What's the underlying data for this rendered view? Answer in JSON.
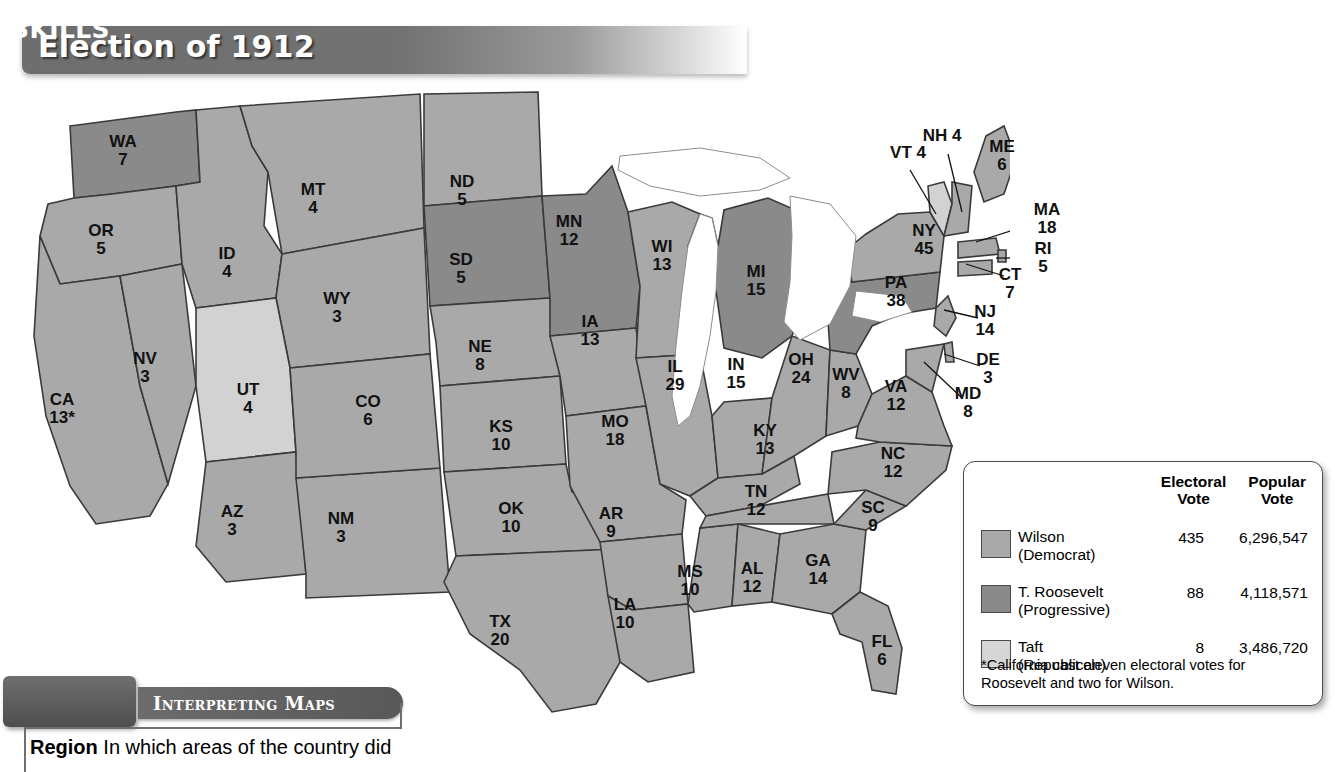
{
  "title": "Election of 1912",
  "chart_data": {
    "type": "map",
    "title": "Election of 1912",
    "categories": [
      "Wilson (Democrat)",
      "T. Roosevelt (Progressive)",
      "Taft (Republican)"
    ],
    "series": [
      {
        "name": "Electoral Vote",
        "values": [
          435,
          88,
          8
        ]
      },
      {
        "name": "Popular Vote",
        "values": [
          6296547,
          4118571,
          3486720
        ]
      }
    ],
    "colors": {
      "wilson": "#a9a9a9",
      "roosevelt": "#8a8a8a",
      "taft": "#d2d2d2"
    },
    "states": [
      {
        "ab": "WA",
        "ev": 7,
        "winner": "roosevelt",
        "x": 123,
        "y": 65
      },
      {
        "ab": "OR",
        "ev": 5,
        "winner": "wilson",
        "x": 101,
        "y": 154
      },
      {
        "ab": "CA",
        "ev": "13*",
        "winner": "wilson",
        "x": 62,
        "y": 323
      },
      {
        "ab": "NV",
        "ev": 3,
        "winner": "wilson",
        "x": 145,
        "y": 282
      },
      {
        "ab": "ID",
        "ev": 4,
        "winner": "wilson",
        "x": 227,
        "y": 177
      },
      {
        "ab": "MT",
        "ev": 4,
        "winner": "wilson",
        "x": 313,
        "y": 113
      },
      {
        "ab": "WY",
        "ev": 3,
        "winner": "wilson",
        "x": 337,
        "y": 222
      },
      {
        "ab": "UT",
        "ev": 4,
        "winner": "taft",
        "x": 248,
        "y": 313
      },
      {
        "ab": "AZ",
        "ev": 3,
        "winner": "wilson",
        "x": 232,
        "y": 435
      },
      {
        "ab": "NM",
        "ev": 3,
        "winner": "wilson",
        "x": 341,
        "y": 442
      },
      {
        "ab": "CO",
        "ev": 6,
        "winner": "wilson",
        "x": 368,
        "y": 325
      },
      {
        "ab": "ND",
        "ev": 5,
        "winner": "wilson",
        "x": 462,
        "y": 105
      },
      {
        "ab": "SD",
        "ev": 5,
        "winner": "roosevelt",
        "x": 461,
        "y": 183
      },
      {
        "ab": "NE",
        "ev": 8,
        "winner": "wilson",
        "x": 480,
        "y": 270
      },
      {
        "ab": "KS",
        "ev": 10,
        "winner": "wilson",
        "x": 501,
        "y": 350
      },
      {
        "ab": "OK",
        "ev": 10,
        "winner": "wilson",
        "x": 511,
        "y": 432
      },
      {
        "ab": "TX",
        "ev": 20,
        "winner": "wilson",
        "x": 500,
        "y": 545
      },
      {
        "ab": "MN",
        "ev": 12,
        "winner": "roosevelt",
        "x": 569,
        "y": 145
      },
      {
        "ab": "IA",
        "ev": 13,
        "winner": "wilson",
        "x": 590,
        "y": 245
      },
      {
        "ab": "MO",
        "ev": 18,
        "winner": "wilson",
        "x": 615,
        "y": 345
      },
      {
        "ab": "AR",
        "ev": 9,
        "winner": "wilson",
        "x": 611,
        "y": 437
      },
      {
        "ab": "LA",
        "ev": 10,
        "winner": "wilson",
        "x": 625,
        "y": 528
      },
      {
        "ab": "WI",
        "ev": 13,
        "winner": "wilson",
        "x": 662,
        "y": 170
      },
      {
        "ab": "IL",
        "ev": 29,
        "winner": "wilson",
        "x": 675,
        "y": 290
      },
      {
        "ab": "MS",
        "ev": 10,
        "winner": "wilson",
        "x": 690,
        "y": 495
      },
      {
        "ab": "MI",
        "ev": 15,
        "winner": "roosevelt",
        "x": 756,
        "y": 195
      },
      {
        "ab": "IN",
        "ev": 15,
        "winner": "wilson",
        "x": 736,
        "y": 288
      },
      {
        "ab": "KY",
        "ev": 13,
        "winner": "wilson",
        "x": 765,
        "y": 354
      },
      {
        "ab": "TN",
        "ev": 12,
        "winner": "wilson",
        "x": 756,
        "y": 415
      },
      {
        "ab": "AL",
        "ev": 12,
        "winner": "wilson",
        "x": 752,
        "y": 492
      },
      {
        "ab": "OH",
        "ev": 24,
        "winner": "wilson",
        "x": 801,
        "y": 283
      },
      {
        "ab": "WV",
        "ev": 8,
        "winner": "wilson",
        "x": 846,
        "y": 298
      },
      {
        "ab": "GA",
        "ev": 14,
        "winner": "wilson",
        "x": 818,
        "y": 484
      },
      {
        "ab": "FL",
        "ev": 6,
        "winner": "wilson",
        "x": 882,
        "y": 565
      },
      {
        "ab": "SC",
        "ev": 9,
        "winner": "wilson",
        "x": 873,
        "y": 431
      },
      {
        "ab": "NC",
        "ev": 12,
        "winner": "wilson",
        "x": 893,
        "y": 377
      },
      {
        "ab": "VA",
        "ev": 12,
        "winner": "wilson",
        "x": 896,
        "y": 310
      },
      {
        "ab": "PA",
        "ev": 38,
        "winner": "roosevelt",
        "x": 896,
        "y": 206
      },
      {
        "ab": "NY",
        "ev": 45,
        "winner": "wilson",
        "x": 924,
        "y": 154
      },
      {
        "ab": "ME",
        "ev": 6,
        "winner": "wilson",
        "x": 1002,
        "y": 70
      },
      {
        "ab": "VT",
        "ev": 4,
        "winner": "taft",
        "x": 908,
        "y": 67
      },
      {
        "ab": "NH",
        "ev": 4,
        "winner": "wilson",
        "x": 942,
        "y": 50
      },
      {
        "ab": "MA",
        "ev": 18,
        "winner": "wilson",
        "x": 1047,
        "y": 133
      },
      {
        "ab": "RI",
        "ev": 5,
        "winner": "wilson",
        "x": 1043,
        "y": 172
      },
      {
        "ab": "CT",
        "ev": 7,
        "winner": "wilson",
        "x": 1010,
        "y": 198
      },
      {
        "ab": "NJ",
        "ev": 14,
        "winner": "wilson",
        "x": 985,
        "y": 235
      },
      {
        "ab": "DE",
        "ev": 3,
        "winner": "wilson",
        "x": 988,
        "y": 283
      },
      {
        "ab": "MD",
        "ev": 8,
        "winner": "wilson",
        "x": 968,
        "y": 317
      }
    ]
  },
  "legend": {
    "header": {
      "electoral": [
        "Electoral",
        "Vote"
      ],
      "popular": [
        "Popular",
        "Vote"
      ]
    },
    "rows": [
      {
        "name": "Wilson",
        "party": "(Democrat)",
        "electoral": "435",
        "popular": "6,296,547",
        "swatch": "wilson-swatch"
      },
      {
        "name": "T. Roosevelt",
        "party": "(Progressive)",
        "electoral": "88",
        "popular": "4,118,571",
        "swatch": "roosevelt-swatch"
      },
      {
        "name": "Taft",
        "party": "(Republican)",
        "electoral": "8",
        "popular": "3,486,720",
        "swatch": "taft-swatch"
      }
    ],
    "note": "*California cast eleven electoral votes for Roosevelt and two for Wilson."
  },
  "footer": {
    "badge_line1": "GEOGRAPHY",
    "badge_line2": "SKILLS",
    "bar_label": "Interpreting Maps",
    "question_label": "Region",
    "question_text": "In which areas of the country did"
  }
}
